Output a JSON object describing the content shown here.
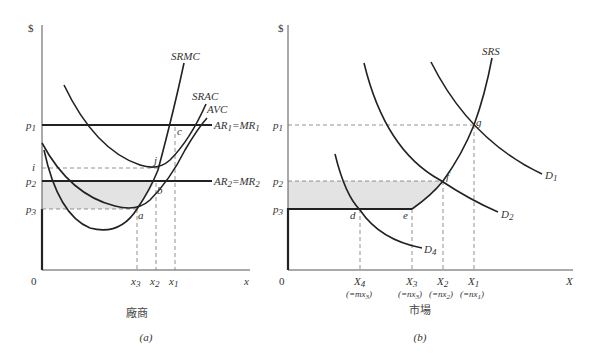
{
  "panel_a": {
    "y_axis_label": "$",
    "x_axis_label": "x",
    "origin_label": "0",
    "caption_title": "廠商",
    "caption_letter": "(a)",
    "y_ticks": {
      "p1": "p",
      "p1_sub": "1",
      "i": "i",
      "p2": "p",
      "p2_sub": "2",
      "p3": "p",
      "p3_sub": "3"
    },
    "x_ticks": {
      "x3": "x",
      "x3_sub": "3",
      "x2": "x",
      "x2_sub": "2",
      "x1": "x",
      "x1_sub": "1"
    },
    "curves": {
      "srmc": "SRMC",
      "srac": "SRAC",
      "avc": "AVC",
      "ar1_mr1": {
        "ar": "AR",
        "ar_sub": "1",
        "eq": "=",
        "mr": "MR",
        "mr_sub": "1"
      },
      "ar2_mr2": {
        "ar": "AR",
        "ar_sub": "2",
        "eq": "=",
        "mr": "MR",
        "mr_sub": "2"
      }
    },
    "points": {
      "c": "c",
      "j": "j",
      "b": "b",
      "a": "a"
    }
  },
  "panel_b": {
    "y_axis_label": "$",
    "x_axis_label": "X",
    "origin_label": "0",
    "caption_title": "市場",
    "caption_letter": "(b)",
    "y_ticks": {
      "p1": "p",
      "p1_sub": "1",
      "p2": "p",
      "p2_sub": "2",
      "p3": "p",
      "p3_sub": "3"
    },
    "x_ticks": {
      "X4": "X",
      "X4_sub": "4",
      "X4_note": "(=mx",
      "X4_note_sub": "3",
      "X4_close": ")",
      "X3": "X",
      "X3_sub": "3",
      "X3_note": "(=nx",
      "X3_note_sub": "3",
      "X3_close": ")",
      "X2": "X",
      "X2_sub": "2",
      "X2_note": "(=nx",
      "X2_note_sub": "2",
      "X2_close": ")",
      "X1": "X",
      "X1_sub": "1",
      "X1_note": "(=nx",
      "X1_note_sub": "1",
      "X1_close": ")"
    },
    "curves": {
      "srs": "SRS",
      "d1": "D",
      "d1_sub": "1",
      "d2": "D",
      "d2_sub": "2",
      "d4": "D",
      "d4_sub": "4"
    },
    "points": {
      "g": "g",
      "f": "f",
      "e": "e",
      "d": "d"
    }
  },
  "colors": {
    "shade": "#e3e3e3",
    "curve": "#222222",
    "dash": "#777777"
  }
}
